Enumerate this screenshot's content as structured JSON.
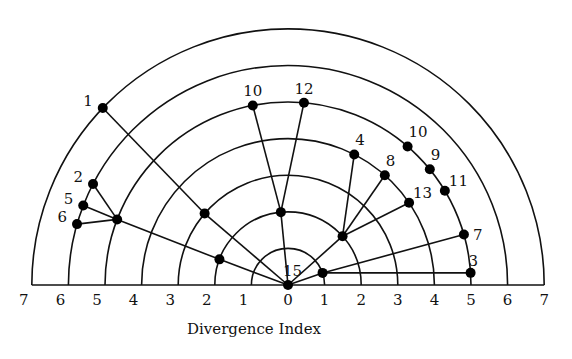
{
  "diagram": {
    "type": "radial-tree",
    "axis_title": "Divergence Index",
    "max_index": 7,
    "tick_labels_left": [
      "7",
      "6",
      "5",
      "4",
      "3",
      "2",
      "1"
    ],
    "tick_label_center": "0",
    "tick_labels_right": [
      "1",
      "2",
      "3",
      "4",
      "5",
      "6",
      "7"
    ],
    "root": {
      "id": "root",
      "label": "15",
      "index": 0,
      "angle": 90
    },
    "nodes": [
      {
        "id": "n1",
        "label": "1",
        "index": 7,
        "angle": 136.3
      },
      {
        "id": "hA",
        "label": "",
        "index": 3,
        "angle": 139.4
      },
      {
        "id": "n2",
        "label": "2",
        "index": 6,
        "angle": 152.6
      },
      {
        "id": "n5",
        "label": "5",
        "index": 6,
        "angle": 158.8
      },
      {
        "id": "n6",
        "label": "6",
        "index": 6,
        "angle": 163.9
      },
      {
        "id": "hB",
        "label": "",
        "index": 5,
        "angle": 159.0
      },
      {
        "id": "hC",
        "label": "",
        "index": 2,
        "angle": 159.5
      },
      {
        "id": "hD",
        "label": "",
        "index": 2,
        "angle": 95.6
      },
      {
        "id": "n10a",
        "label": "10",
        "index": 5,
        "angle": 101.1
      },
      {
        "id": "n12",
        "label": "12",
        "index": 5,
        "angle": 85.0
      },
      {
        "id": "hE",
        "label": "",
        "index": 2,
        "angle": 41.8
      },
      {
        "id": "n4",
        "label": "4",
        "index": 4,
        "angle": 63.1
      },
      {
        "id": "n8",
        "label": "8",
        "index": 4,
        "angle": 48.6
      },
      {
        "id": "n13",
        "label": "13",
        "index": 4,
        "angle": 34.2
      },
      {
        "id": "n10b",
        "label": "10",
        "index": 5,
        "angle": 49.2
      },
      {
        "id": "n9",
        "label": "9",
        "index": 5,
        "angle": 39.2
      },
      {
        "id": "n11",
        "label": "11",
        "index": 5,
        "angle": 31.0
      },
      {
        "id": "hF",
        "label": "",
        "index": 1,
        "angle": 19.3
      },
      {
        "id": "n7",
        "label": "7",
        "index": 5,
        "angle": 16.0
      },
      {
        "id": "n3",
        "label": "3",
        "index": 5,
        "angle": 3.8
      }
    ],
    "edges": [
      [
        "root",
        "hA"
      ],
      [
        "hA",
        "n1"
      ],
      [
        "root",
        "hC"
      ],
      [
        "hC",
        "hB"
      ],
      [
        "hB",
        "n2"
      ],
      [
        "hB",
        "n5"
      ],
      [
        "hB",
        "n6"
      ],
      [
        "root",
        "hD"
      ],
      [
        "hD",
        "n10a"
      ],
      [
        "hD",
        "n12"
      ],
      [
        "root",
        "hE"
      ],
      [
        "hE",
        "n4"
      ],
      [
        "hE",
        "n8"
      ],
      [
        "hE",
        "n13"
      ],
      [
        "root",
        "hF"
      ],
      [
        "hF",
        "n7"
      ],
      [
        "hF",
        "n3"
      ]
    ]
  }
}
